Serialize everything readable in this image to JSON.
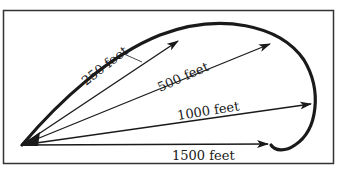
{
  "diagram": {
    "colors": {
      "ink": "#1a1a1a",
      "frame": "#333333",
      "background": "#ffffff"
    },
    "distances": [
      {
        "label": "250 feet",
        "value_ft": 250
      },
      {
        "label": "500 feet",
        "value_ft": 500
      },
      {
        "label": "1000 feet",
        "value_ft": 1000
      },
      {
        "label": "1500 feet",
        "value_ft": 1500
      }
    ]
  }
}
